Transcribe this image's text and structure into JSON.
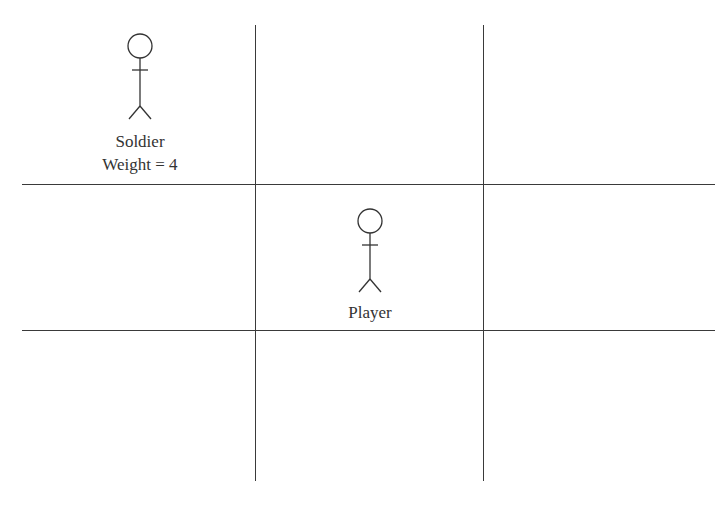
{
  "diagram": {
    "type": "3x3 grid with stick figures",
    "grid": {
      "horizontal_lines_y": [
        184,
        330
      ],
      "vertical_lines_x": [
        255,
        483
      ],
      "line_color": "#3a3a3a"
    },
    "characters": [
      {
        "id": "soldier",
        "name": "Soldier",
        "weight_label": "Weight = 4",
        "cell": "top-left"
      },
      {
        "id": "player",
        "name": "Player",
        "cell": "center"
      }
    ]
  }
}
